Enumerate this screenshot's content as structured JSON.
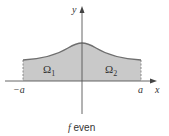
{
  "diagram": {
    "caption_f": "f",
    "caption_rest": " even",
    "axis_labels": {
      "x": "x",
      "y": "y"
    },
    "tick_labels": {
      "left": "−a",
      "right": "a"
    },
    "regions": [
      {
        "symbol": "Ω",
        "sub": "1"
      },
      {
        "symbol": "Ω",
        "sub": "2"
      }
    ],
    "colors": {
      "fill": "#c9c9c9",
      "curve": "#6e6e6e",
      "axis": "#555555",
      "text": "#333333"
    }
  }
}
